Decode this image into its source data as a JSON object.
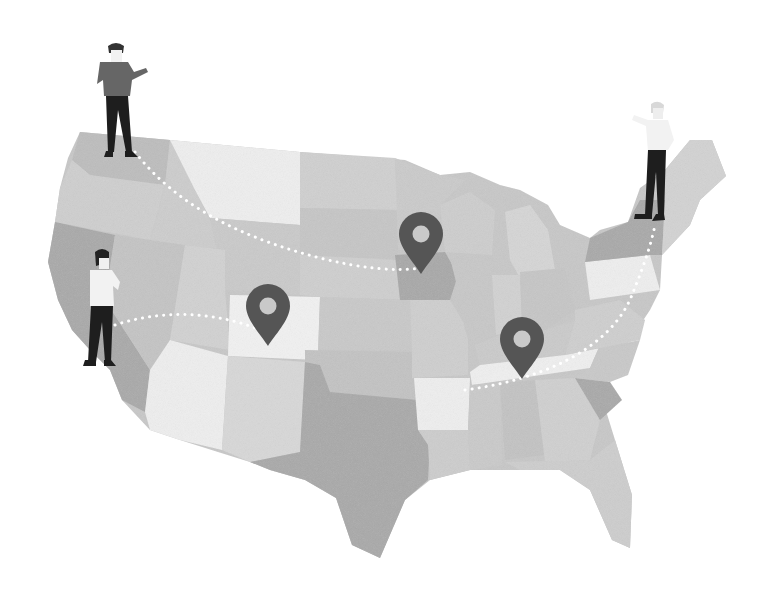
{
  "illustration": {
    "subject": "United States map with location pins and people",
    "style": "grayscale",
    "colors": {
      "background": "#ffffff",
      "state_light": "#f0f0f0",
      "state_mid": "#d6d6d6",
      "state_base": "#c8c8c8",
      "state_dark": "#a9a9a9",
      "pin": "#555555",
      "pin_hole": "#c9c9c9",
      "person_pants": "#1e1e1e",
      "person_shirt_dark": "#666666",
      "person_shirt_light": "#f2f2f2",
      "route_dots": "#ffffff"
    },
    "pins": [
      {
        "name": "pin-colorado",
        "x": 268,
        "y": 312
      },
      {
        "name": "pin-iowa",
        "x": 421,
        "y": 240
      },
      {
        "name": "pin-tennessee",
        "x": 522,
        "y": 345
      }
    ],
    "people": [
      {
        "name": "person-washington",
        "x": 115,
        "y": 100
      },
      {
        "name": "person-california",
        "x": 100,
        "y": 310
      },
      {
        "name": "person-new-york",
        "x": 655,
        "y": 160
      }
    ]
  }
}
